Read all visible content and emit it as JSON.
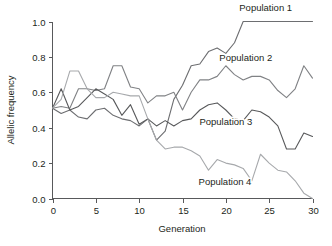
{
  "chart_data": {
    "type": "line",
    "title": "",
    "xlabel": "Generation",
    "ylabel": "Allelic frequency",
    "xlim": [
      0,
      30
    ],
    "ylim": [
      0.0,
      1.0
    ],
    "xticks": [
      0,
      5,
      10,
      15,
      20,
      25,
      30
    ],
    "xtick_labels": [
      "0",
      "5",
      "10",
      "15",
      "20",
      "25",
      "30"
    ],
    "yticks": [
      0.0,
      0.2,
      0.4,
      0.6,
      0.8,
      1.0
    ],
    "ytick_labels": [
      "0.0",
      "0.2",
      "0.4",
      "0.6",
      "0.8",
      "1.0"
    ],
    "grid": false,
    "legend_position": "inline-annotations",
    "x": [
      0,
      1,
      2,
      3,
      4,
      5,
      6,
      7,
      8,
      9,
      10,
      11,
      12,
      13,
      14,
      15,
      16,
      17,
      18,
      19,
      20,
      21,
      22,
      23,
      24,
      25,
      26,
      27,
      28,
      29,
      30
    ],
    "series": [
      {
        "name": "Population 1",
        "color": "#6d6e71",
        "label_x": 24.6,
        "label_y": 1.06,
        "values": [
          0.51,
          0.48,
          0.5,
          0.46,
          0.45,
          0.5,
          0.51,
          0.47,
          0.45,
          0.44,
          0.41,
          0.45,
          0.33,
          0.38,
          0.56,
          0.64,
          0.75,
          0.76,
          0.83,
          0.85,
          0.82,
          0.88,
          1.0,
          1.0,
          1.0,
          1.0,
          1.0,
          1.0,
          1.0,
          1.0,
          1.0
        ]
      },
      {
        "name": "Population 2",
        "color": "#808285",
        "label_x": 22.3,
        "label_y": 0.775,
        "values": [
          0.51,
          0.52,
          0.51,
          0.62,
          0.62,
          0.61,
          0.62,
          0.75,
          0.75,
          0.63,
          0.62,
          0.54,
          0.58,
          0.58,
          0.6,
          0.5,
          0.6,
          0.67,
          0.67,
          0.69,
          0.75,
          0.7,
          0.67,
          0.69,
          0.69,
          0.67,
          0.61,
          0.57,
          0.62,
          0.75,
          0.68
        ]
      },
      {
        "name": "Population 3",
        "color": "#58595b",
        "label_x": 20.0,
        "label_y": 0.415,
        "values": [
          0.51,
          0.62,
          0.5,
          0.52,
          0.57,
          0.62,
          0.59,
          0.56,
          0.47,
          0.53,
          0.42,
          0.45,
          0.41,
          0.44,
          0.41,
          0.44,
          0.45,
          0.5,
          0.53,
          0.54,
          0.5,
          0.45,
          0.44,
          0.5,
          0.49,
          0.46,
          0.41,
          0.28,
          0.28,
          0.37,
          0.35
        ]
      },
      {
        "name": "Population 4",
        "color": "#a7a9ac",
        "label_x": 19.9,
        "label_y": 0.075,
        "values": [
          0.51,
          0.56,
          0.72,
          0.72,
          0.62,
          0.57,
          0.57,
          0.6,
          0.59,
          0.58,
          0.58,
          0.45,
          0.33,
          0.28,
          0.29,
          0.29,
          0.27,
          0.24,
          0.16,
          0.22,
          0.2,
          0.19,
          0.17,
          0.1,
          0.25,
          0.2,
          0.16,
          0.15,
          0.1,
          0.03,
          0.0
        ]
      }
    ]
  },
  "axes": {
    "x_axis_title": "Generation",
    "y_axis_title": "Allelic frequency"
  }
}
